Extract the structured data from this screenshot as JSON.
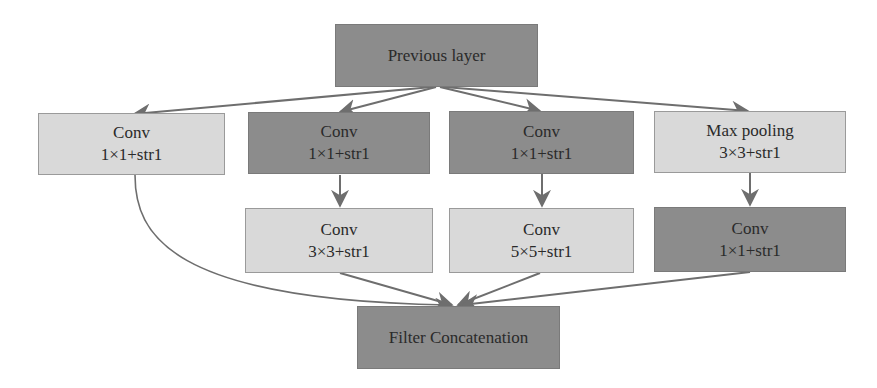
{
  "diagram": {
    "type": "flowchart",
    "nodes": {
      "previous_layer": {
        "label": "Previous layer",
        "shade": "dark"
      },
      "b1_conv1": {
        "line1": "Conv",
        "line2": "1×1+str1",
        "shade": "light"
      },
      "b2_conv1": {
        "line1": "Conv",
        "line2": "1×1+str1",
        "shade": "dark"
      },
      "b3_conv1": {
        "line1": "Conv",
        "line2": "1×1+str1",
        "shade": "dark"
      },
      "b4_pool": {
        "line1": "Max pooling",
        "line2": "3×3+str1",
        "shade": "light"
      },
      "b2_conv3": {
        "line1": "Conv",
        "line2": "3×3+str1",
        "shade": "light"
      },
      "b3_conv5": {
        "line1": "Conv",
        "line2": "5×5+str1",
        "shade": "light"
      },
      "b4_conv1": {
        "line1": "Conv",
        "line2": "1×1+str1",
        "shade": "dark"
      },
      "filter_concat": {
        "label": "Filter Concatenation",
        "shade": "dark"
      }
    },
    "edges": [
      [
        "previous_layer",
        "b1_conv1"
      ],
      [
        "previous_layer",
        "b2_conv1"
      ],
      [
        "previous_layer",
        "b3_conv1"
      ],
      [
        "previous_layer",
        "b4_pool"
      ],
      [
        "b2_conv1",
        "b2_conv3"
      ],
      [
        "b3_conv1",
        "b3_conv5"
      ],
      [
        "b4_pool",
        "b4_conv1"
      ],
      [
        "b1_conv1",
        "filter_concat"
      ],
      [
        "b2_conv3",
        "filter_concat"
      ],
      [
        "b3_conv5",
        "filter_concat"
      ],
      [
        "b4_conv1",
        "filter_concat"
      ]
    ],
    "colors": {
      "dark_fill": "#8c8c8c",
      "light_fill": "#d9d9d9",
      "edge": "#6e6e6e",
      "text": "#2a2a2a"
    }
  }
}
